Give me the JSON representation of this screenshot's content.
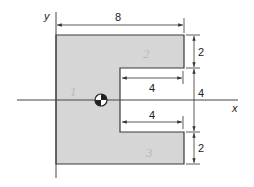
{
  "figure": {
    "colors": {
      "fill": "#d6d6d6",
      "stroke": "#3a3a3a",
      "dimension_line": "#333333",
      "background": "#ffffff"
    },
    "axes": {
      "x_label": "x",
      "y_label": "y"
    },
    "dimensions": {
      "overall_width": "8",
      "top_flange_height": "2",
      "opening_height": "4",
      "bottom_flange_height": "2",
      "upper_notch_depth": "4",
      "lower_notch_depth": "4"
    },
    "region_labels": [
      "1",
      "2",
      "3"
    ],
    "centroid_icon": "centroid-symbol"
  }
}
